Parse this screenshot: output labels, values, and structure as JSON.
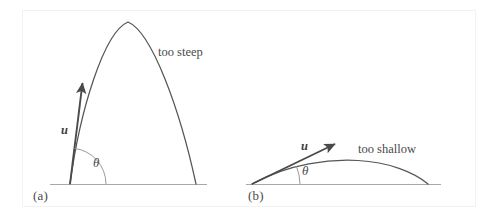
{
  "figure": {
    "background_color": "#ffffff",
    "frame_color": "#f2f2f2",
    "ink_color": "#4a4a4a",
    "ground_color": "#a8a8a8",
    "panels": [
      {
        "id": "a",
        "label": "(a)",
        "caption": "too steep",
        "vector_label": "u",
        "angle_label": "θ",
        "description_of_trajectory": "steep parabolic projectile arc",
        "launch_angle_degrees": 80,
        "ground_y": 184,
        "launch_x": 70,
        "apex_x": 128,
        "apex_y": 22,
        "landing_x": 196,
        "arrow_tip_x": 82,
        "arrow_tip_y": 79
      },
      {
        "id": "b",
        "label": "(b)",
        "caption": "too shallow",
        "vector_label": "u",
        "angle_label": "θ",
        "description_of_trajectory": "shallow parabolic projectile arc",
        "launch_angle_degrees": 22,
        "ground_y": 184,
        "launch_x": 252,
        "apex_x": 358,
        "apex_y": 161,
        "landing_x": 428,
        "arrow_tip_x": 338,
        "arrow_tip_y": 142
      }
    ]
  }
}
